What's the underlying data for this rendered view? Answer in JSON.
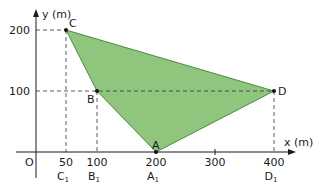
{
  "axes": {
    "x_label": "x (m)",
    "y_label": "y (m)",
    "origin_label": "O",
    "x_ticks": [
      {
        "value": "50",
        "sub_label": "C",
        "sub_index": "1"
      },
      {
        "value": "100",
        "sub_label": "B",
        "sub_index": "1"
      },
      {
        "value": "200",
        "sub_label": "A",
        "sub_index": "1"
      },
      {
        "value": "300",
        "sub_label": "",
        "sub_index": ""
      },
      {
        "value": "400",
        "sub_label": "D",
        "sub_index": "1"
      }
    ],
    "y_ticks": [
      {
        "value": "200"
      },
      {
        "value": "100"
      }
    ]
  },
  "points": {
    "A": {
      "label": "A",
      "x": 200,
      "y": 0
    },
    "B": {
      "label": "B",
      "x": 100,
      "y": 100
    },
    "C": {
      "label": "C",
      "x": 50,
      "y": 200
    },
    "D": {
      "label": "D",
      "x": 400,
      "y": 100
    }
  },
  "polygon": {
    "vertices": [
      "C",
      "D",
      "A",
      "B"
    ],
    "fill_color": "#8fc57c",
    "stroke_color": "#4e8a3f"
  },
  "colors": {
    "axis": "#1a1a1a",
    "dashed": "#333333"
  }
}
